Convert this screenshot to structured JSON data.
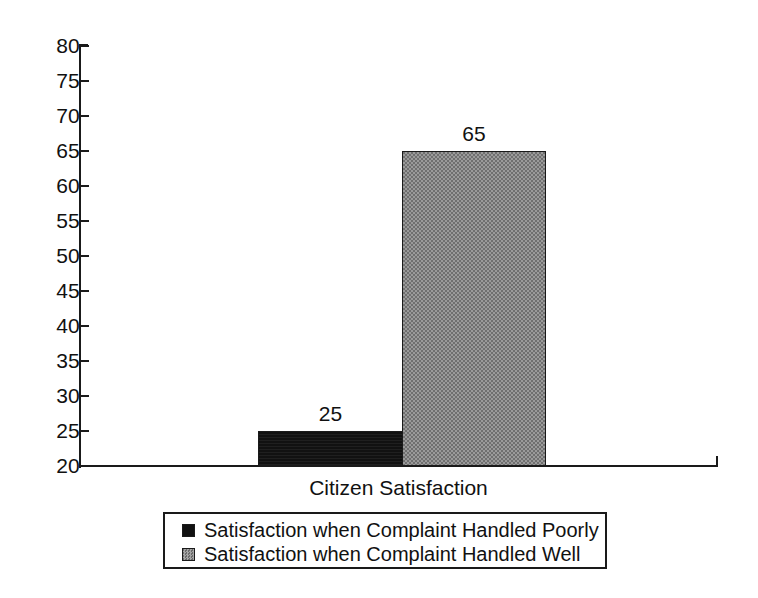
{
  "chart_data": {
    "type": "bar",
    "title": "",
    "xlabel": "Citizen Satisfaction",
    "ylabel": "",
    "categories": [
      "Citizen Satisfaction"
    ],
    "series": [
      {
        "name": "Satisfaction when Complaint Handled Poorly",
        "values": [
          25
        ],
        "color": "#111111",
        "swatch": "dark"
      },
      {
        "name": "Satisfaction when Complaint Handled Well",
        "values": [
          65
        ],
        "color": "#8a8a8a",
        "swatch": "gray"
      }
    ],
    "ylim": [
      20,
      80
    ],
    "ytick_step": 5,
    "ytick_labels": [
      "80",
      "75",
      "70",
      "65",
      "60",
      "55",
      "50",
      "45",
      "40",
      "35",
      "30",
      "25",
      "20"
    ],
    "data_labels": [
      "25",
      "65"
    ],
    "grid": false,
    "legend_position": "bottom"
  },
  "axis": {
    "ticks": [
      {
        "label": "80",
        "value": 80
      },
      {
        "label": "75",
        "value": 75
      },
      {
        "label": "70",
        "value": 70
      },
      {
        "label": "65",
        "value": 65
      },
      {
        "label": "60",
        "value": 60
      },
      {
        "label": "55",
        "value": 55
      },
      {
        "label": "50",
        "value": 50
      },
      {
        "label": "45",
        "value": 45
      },
      {
        "label": "40",
        "value": 40
      },
      {
        "label": "35",
        "value": 35
      },
      {
        "label": "30",
        "value": 30
      },
      {
        "label": "25",
        "value": 25
      },
      {
        "label": "20",
        "value": 20
      }
    ]
  },
  "bars": [
    {
      "label": "25",
      "value": 25,
      "series": "Satisfaction when Complaint Handled Poorly"
    },
    {
      "label": "65",
      "value": 65,
      "series": "Satisfaction when Complaint Handled Well"
    }
  ],
  "legend": {
    "items": [
      {
        "label": "Satisfaction when Complaint Handled Poorly",
        "swatch": "dark"
      },
      {
        "label": "Satisfaction when Complaint Handled Well",
        "swatch": "gray"
      }
    ]
  },
  "xaxis_title": "Citizen Satisfaction"
}
